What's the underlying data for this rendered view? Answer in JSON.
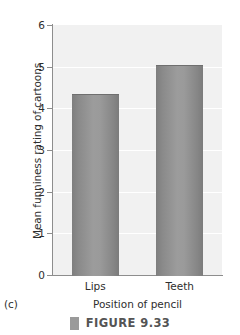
{
  "panel": {
    "letter": "(c)"
  },
  "caption": {
    "marker_icon": "square-marker-icon",
    "text": "FIGURE 9.33"
  },
  "chart_data": {
    "type": "bar",
    "title": "",
    "xlabel": "Position of pencil",
    "ylabel": "Mean funniness rating of cartoons",
    "categories": [
      "Lips",
      "Teeth"
    ],
    "values": [
      4.35,
      5.05
    ],
    "ylim": [
      0,
      6
    ],
    "yticks": [
      0,
      1,
      2,
      3,
      4,
      5,
      6
    ],
    "ytick_labels": [
      "0",
      "1",
      "2",
      "3",
      "4",
      "5",
      "6"
    ],
    "grid": true,
    "grid_axis": "y",
    "legend": false,
    "legend_position": "none",
    "plot_background": "#f1f1f1",
    "bar_color": "#909090",
    "axis_color": "#8d8d8d",
    "gridline_color": "#ffffff"
  }
}
